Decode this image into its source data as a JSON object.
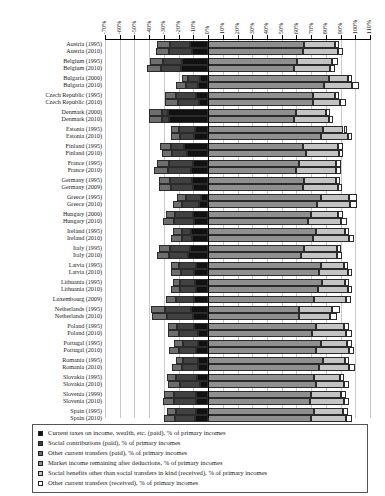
{
  "chart_data": {
    "type": "bar",
    "orientation": "horizontal",
    "stacked": true,
    "title": "",
    "xlabel": "",
    "ylabel": "",
    "xlim": [
      -70,
      110
    ],
    "xticks": [
      "-70%",
      "-60%",
      "-50%",
      "-40%",
      "-30%",
      "-20%",
      "-10%",
      "0%",
      "10%",
      "20%",
      "30%",
      "40%",
      "50%",
      "60%",
      "70%",
      "80%",
      "90%",
      "100%",
      "110%"
    ],
    "xtick_values": [
      -70,
      -60,
      -50,
      -40,
      -30,
      -20,
      -10,
      0,
      10,
      20,
      30,
      40,
      50,
      60,
      70,
      80,
      90,
      100,
      110
    ],
    "grid": true,
    "legend_position": "bottom",
    "series": [
      {
        "name": "Current taxes on income, wealth, etc. (paid), % of primary incomes",
        "color": "#111111",
        "sign": "negative"
      },
      {
        "name": "Social contributions (paid), % of primary incomes",
        "color": "#414141",
        "sign": "negative"
      },
      {
        "name": "Other current transfers (paid), % of primary incomes",
        "color": "#6e6e6e",
        "sign": "negative"
      },
      {
        "name": "Market income remaining after deductions, % of primary incomes",
        "color": "#8f8f8f",
        "sign": "positive"
      },
      {
        "name": "Social benefits other than social transfers in kind (received), % of primary incomes",
        "color": "#c4c4c4",
        "sign": "positive"
      },
      {
        "name": "Other current transfers (received), % of primary incomes",
        "color": "#ffffff",
        "sign": "positive"
      }
    ],
    "categories": [
      "Austria (1995)",
      "Austria (2010)",
      "Belgium (1995)",
      "Belgium (2010)",
      "Bulgaria (2000)",
      "Bulgaria (2010)",
      "Czech Republic (1995)",
      "Czech Republic (2010)",
      "Denmark (2000)",
      "Denmark (2010)",
      "Estonia (1995)",
      "Estonia (2010)",
      "Finland (1995)",
      "Finland (2010)",
      "France (1995)",
      "France (2010)",
      "Germany (1995)",
      "Germany (2009)",
      "Greece (1995)",
      "Greece (2010)",
      "Hungary (2000)",
      "Hungary (2010)",
      "Ireland (1995)",
      "Ireland (2010)",
      "Italy (1995)",
      "Italy (2010)",
      "Latvia (1995)",
      "Latvia (2010)",
      "Lithuania (1995)",
      "Lithuania (2010)",
      "Luxembourg (2009)",
      "Netherlands (1995)",
      "Netherlands (2010)",
      "Poland (1995)",
      "Poland (2010)",
      "Portugal (1995)",
      "Portugal (2010)",
      "Romania (1995)",
      "Romania (2010)",
      "Slovakia (1995)",
      "Slovakia (2010)",
      "Slovenia (1999)",
      "Slovenia (2010)",
      "Spain (1995)",
      "Spain (2010)",
      "Sweden (1995)",
      "Sweden (2010)",
      "United Kingdom (1995)",
      "United Kingdom (2010)"
    ],
    "group_breaks": [
      2,
      4,
      6,
      8,
      10,
      12,
      14,
      16,
      18,
      20,
      22,
      24,
      26,
      28,
      30,
      31,
      33,
      35,
      37,
      39,
      41,
      43,
      45,
      47
    ],
    "rows": [
      {
        "category": "Austria (1995)",
        "taxes": -12.0,
        "contrib": -14.0,
        "other_paid": -8.5,
        "market": 65.5,
        "benefits": 21.0,
        "other_recv": 2.5
      },
      {
        "category": "Austria (2010)",
        "taxes": -11.0,
        "contrib": -15.5,
        "other_paid": -9.0,
        "market": 64.5,
        "benefits": 24.0,
        "other_recv": 3.0
      },
      {
        "category": "Belgium (1995)",
        "taxes": -17.5,
        "contrib": -13.0,
        "other_paid": -9.0,
        "market": 60.5,
        "benefits": 24.0,
        "other_recv": 3.5
      },
      {
        "category": "Belgium (2010)",
        "taxes": -18.5,
        "contrib": -13.5,
        "other_paid": -9.5,
        "market": 58.5,
        "benefits": 24.5,
        "other_recv": 3.0
      },
      {
        "category": "Bulgaria (2000)",
        "taxes": -5.5,
        "contrib": -8.0,
        "other_paid": -4.5,
        "market": 82.0,
        "benefits": 13.0,
        "other_recv": 3.0
      },
      {
        "category": "Bulgaria (2010)",
        "taxes": -6.5,
        "contrib": -8.5,
        "other_paid": -6.5,
        "market": 78.5,
        "benefits": 19.0,
        "other_recv": 5.0
      },
      {
        "category": "Czech Republic (1995)",
        "taxes": -8.0,
        "contrib": -13.5,
        "other_paid": -7.5,
        "market": 71.0,
        "benefits": 15.5,
        "other_recv": 2.5
      },
      {
        "category": "Czech Republic (2010)",
        "taxes": -6.0,
        "contrib": -14.5,
        "other_paid": -8.5,
        "market": 71.0,
        "benefits": 18.5,
        "other_recv": 4.0
      },
      {
        "category": "Denmark (2000)",
        "taxes": -27.5,
        "contrib": -4.0,
        "other_paid": -8.5,
        "market": 60.0,
        "benefits": 20.0,
        "other_recv": 2.5
      },
      {
        "category": "Denmark (2010)",
        "taxes": -26.5,
        "contrib": -4.5,
        "other_paid": -9.0,
        "market": 58.5,
        "benefits": 23.5,
        "other_recv": 3.0
      },
      {
        "category": "Estonia (1995)",
        "taxes": -9.0,
        "contrib": -11.0,
        "other_paid": -5.5,
        "market": 78.0,
        "benefits": 14.0,
        "other_recv": 2.5
      },
      {
        "category": "Estonia (2010)",
        "taxes": -9.5,
        "contrib": -9.5,
        "other_paid": -6.5,
        "market": 76.5,
        "benefits": 18.5,
        "other_recv": 3.0
      },
      {
        "category": "Finland (1995)",
        "taxes": -16.5,
        "contrib": -8.5,
        "other_paid": -7.5,
        "market": 64.5,
        "benefits": 24.0,
        "other_recv": 3.0
      },
      {
        "category": "Finland (2010)",
        "taxes": -14.5,
        "contrib": -10.0,
        "other_paid": -7.0,
        "market": 66.5,
        "benefits": 22.5,
        "other_recv": 3.0
      },
      {
        "category": "France (1995)",
        "taxes": -10.0,
        "contrib": -16.5,
        "other_paid": -8.5,
        "market": 61.5,
        "benefits": 25.5,
        "other_recv": 3.5
      },
      {
        "category": "France (2010)",
        "taxes": -11.5,
        "contrib": -16.0,
        "other_paid": -9.0,
        "market": 60.0,
        "benefits": 27.0,
        "other_recv": 3.5
      },
      {
        "category": "Germany (1995)",
        "taxes": -11.0,
        "contrib": -15.0,
        "other_paid": -7.5,
        "market": 65.0,
        "benefits": 22.0,
        "other_recv": 2.5
      },
      {
        "category": "Germany (2009)",
        "taxes": -10.0,
        "contrib": -15.5,
        "other_paid": -8.0,
        "market": 64.5,
        "benefits": 23.5,
        "other_recv": 3.0
      },
      {
        "category": "Greece (1995)",
        "taxes": -4.5,
        "contrib": -10.5,
        "other_paid": -6.0,
        "market": 77.0,
        "benefits": 19.0,
        "other_recv": 5.5
      },
      {
        "category": "Greece (2010)",
        "taxes": -6.0,
        "contrib": -11.5,
        "other_paid": -6.5,
        "market": 74.0,
        "benefits": 22.5,
        "other_recv": 5.0
      },
      {
        "category": "Hungary (2000)",
        "taxes": -10.0,
        "contrib": -12.5,
        "other_paid": -6.0,
        "market": 70.0,
        "benefits": 18.0,
        "other_recv": 3.5
      },
      {
        "category": "Hungary (2010)",
        "taxes": -9.5,
        "contrib": -13.5,
        "other_paid": -7.5,
        "market": 68.0,
        "benefits": 22.5,
        "other_recv": 4.0
      },
      {
        "category": "Ireland (1995)",
        "taxes": -11.5,
        "contrib": -6.0,
        "other_paid": -6.5,
        "market": 73.5,
        "benefits": 19.5,
        "other_recv": 3.0
      },
      {
        "category": "Ireland (2010)",
        "taxes": -11.0,
        "contrib": -6.5,
        "other_paid": -7.5,
        "market": 71.5,
        "benefits": 24.0,
        "other_recv": 3.5
      },
      {
        "category": "Italy (1995)",
        "taxes": -12.5,
        "contrib": -13.5,
        "other_paid": -7.5,
        "market": 65.0,
        "benefits": 22.5,
        "other_recv": 3.0
      },
      {
        "category": "Italy (2010)",
        "taxes": -13.5,
        "contrib": -13.0,
        "other_paid": -8.0,
        "market": 63.0,
        "benefits": 24.5,
        "other_recv": 3.5
      },
      {
        "category": "Latvia (1995)",
        "taxes": -8.5,
        "contrib": -11.5,
        "other_paid": -5.0,
        "market": 76.5,
        "benefits": 16.0,
        "other_recv": 2.5
      },
      {
        "category": "Latvia (2010)",
        "taxes": -9.5,
        "contrib": -9.0,
        "other_paid": -6.5,
        "market": 75.5,
        "benefits": 19.5,
        "other_recv": 3.0
      },
      {
        "category": "Lithuania (1995)",
        "taxes": -9.0,
        "contrib": -10.0,
        "other_paid": -5.0,
        "market": 77.5,
        "benefits": 15.5,
        "other_recv": 2.5
      },
      {
        "category": "Lithuania (2010)",
        "taxes": -8.5,
        "contrib": -10.5,
        "other_paid": -6.0,
        "market": 75.0,
        "benefits": 20.0,
        "other_recv": 3.0
      },
      {
        "category": "Luxembourg (2009)",
        "taxes": -9.5,
        "contrib": -12.0,
        "other_paid": -7.0,
        "market": 72.0,
        "benefits": 21.5,
        "other_recv": 3.5
      },
      {
        "category": "Netherlands (1995)",
        "taxes": -11.5,
        "contrib": -17.5,
        "other_paid": -9.5,
        "market": 61.5,
        "benefits": 23.0,
        "other_recv": 5.0
      },
      {
        "category": "Netherlands (2010)",
        "taxes": -10.0,
        "contrib": -18.0,
        "other_paid": -10.0,
        "market": 62.0,
        "benefits": 21.0,
        "other_recv": 4.5
      },
      {
        "category": "Poland (1995)",
        "taxes": -9.5,
        "contrib": -11.5,
        "other_paid": -6.0,
        "market": 73.0,
        "benefits": 19.5,
        "other_recv": 3.0
      },
      {
        "category": "Poland (2010)",
        "taxes": -7.0,
        "contrib": -13.0,
        "other_paid": -7.5,
        "market": 70.5,
        "benefits": 23.5,
        "other_recv": 3.5
      },
      {
        "category": "Portugal (1995)",
        "taxes": -6.5,
        "contrib": -10.5,
        "other_paid": -6.0,
        "market": 77.0,
        "benefits": 17.5,
        "other_recv": 3.5
      },
      {
        "category": "Portugal (2010)",
        "taxes": -8.0,
        "contrib": -11.5,
        "other_paid": -7.0,
        "market": 73.5,
        "benefits": 22.0,
        "other_recv": 3.5
      },
      {
        "category": "Romania (1995)",
        "taxes": -7.0,
        "contrib": -10.0,
        "other_paid": -5.0,
        "market": 78.0,
        "benefits": 15.0,
        "other_recv": 3.0
      },
      {
        "category": "Romania (2010)",
        "taxes": -6.5,
        "contrib": -11.5,
        "other_paid": -6.5,
        "market": 75.5,
        "benefits": 20.5,
        "other_recv": 4.0
      },
      {
        "category": "Slovakia (1995)",
        "taxes": -7.5,
        "contrib": -14.0,
        "other_paid": -6.5,
        "market": 72.0,
        "benefits": 17.5,
        "other_recv": 3.0
      },
      {
        "category": "Slovakia (2010)",
        "taxes": -5.5,
        "contrib": -13.5,
        "other_paid": -8.0,
        "market": 73.0,
        "benefits": 19.5,
        "other_recv": 3.5
      },
      {
        "category": "Slovenia (1999)",
        "taxes": -8.5,
        "contrib": -14.5,
        "other_paid": -7.0,
        "market": 70.0,
        "benefits": 20.5,
        "other_recv": 3.0
      },
      {
        "category": "Slovenia (2010)",
        "taxes": -8.0,
        "contrib": -15.0,
        "other_paid": -7.5,
        "market": 69.5,
        "benefits": 23.0,
        "other_recv": 3.5
      },
      {
        "category": "Spain (1995)",
        "taxes": -8.5,
        "contrib": -13.0,
        "other_paid": -6.5,
        "market": 72.0,
        "benefits": 19.5,
        "other_recv": 3.5
      },
      {
        "category": "Spain (2010)",
        "taxes": -9.0,
        "contrib": -13.5,
        "other_paid": -7.5,
        "market": 70.0,
        "benefits": 24.0,
        "other_recv": 4.0
      },
      {
        "category": "Sweden (1995)",
        "taxes": -18.5,
        "contrib": -7.5,
        "other_paid": -8.5,
        "market": 62.5,
        "benefits": 25.0,
        "other_recv": 3.0
      },
      {
        "category": "Sweden (2010)",
        "taxes": -16.0,
        "contrib": -9.0,
        "other_paid": -8.0,
        "market": 67.0,
        "benefits": 21.5,
        "other_recv": 3.0
      },
      {
        "category": "United Kingdom (1995)",
        "taxes": -11.5,
        "contrib": -8.0,
        "other_paid": -7.0,
        "market": 73.5,
        "benefits": 18.5,
        "other_recv": 3.0
      },
      {
        "category": "United Kingdom (2010)",
        "taxes": -11.0,
        "contrib": -8.5,
        "other_paid": -8.0,
        "market": 72.5,
        "benefits": 21.5,
        "other_recv": 3.5
      }
    ]
  },
  "legend": {
    "items": [
      {
        "label": "Current taxes on income, wealth, etc. (paid), % of primary incomes",
        "color": "#111111"
      },
      {
        "label": "Social contributions (paid), % of primary incomes",
        "color": "#414141"
      },
      {
        "label": "Other current transfers (paid), % of primary incomes",
        "color": "#6e6e6e"
      },
      {
        "label": "Market income remaining after deductions, % of primary incomes",
        "color": "#8f8f8f"
      },
      {
        "label": "Social benefits other than social transfers in kind (received), % of primary incomes",
        "color": "#c4c4c4"
      },
      {
        "label": "Other current transfers (received), % of primary incomes",
        "color": "#ffffff"
      }
    ]
  }
}
